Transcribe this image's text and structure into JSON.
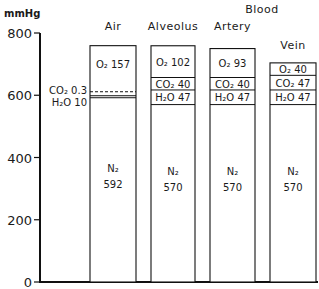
{
  "chart_data": {
    "type": "bar",
    "stacked": true,
    "title": "",
    "ylabel": "mmHg",
    "xlabel": "",
    "ylim": [
      0,
      800
    ],
    "yticks": [
      0,
      200,
      400,
      600,
      800
    ],
    "grid": false,
    "group_label": "Blood",
    "group_label_spans": [
      "Artery",
      "Vein"
    ],
    "categories": [
      "Air",
      "Alveolus",
      "Artery",
      "Vein"
    ],
    "series": [
      {
        "name": "N2",
        "label": "N₂",
        "values": [
          592,
          570,
          570,
          570
        ]
      },
      {
        "name": "H2O",
        "label": "H₂O",
        "values": [
          10,
          47,
          47,
          47
        ]
      },
      {
        "name": "CO2",
        "label": "CO₂",
        "values": [
          0.3,
          40,
          40,
          47
        ]
      },
      {
        "name": "O2",
        "label": "O₂",
        "values": [
          157,
          102,
          93,
          40
        ]
      }
    ],
    "annotations": [
      {
        "category": "Air",
        "text": "CO₂ 0.3",
        "position": "left-outside"
      },
      {
        "category": "Air",
        "text": "H₂O 10",
        "position": "left-outside"
      }
    ]
  },
  "labels": {
    "unit": "mmHg",
    "group": "Blood",
    "yticks": [
      "0",
      "200",
      "400",
      "600",
      "800"
    ],
    "categories": [
      "Air",
      "Alveolus",
      "Artery",
      "Vein"
    ]
  }
}
